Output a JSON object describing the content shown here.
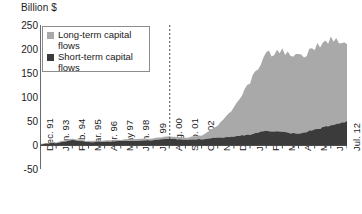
{
  "chart_data": {
    "type": "area",
    "title": "",
    "ylabel": "Billion $",
    "xlabel": "",
    "stacked": true,
    "grid": false,
    "legend_position": "top-left",
    "ylim": [
      -50,
      250
    ],
    "yticks": [
      250,
      200,
      150,
      100,
      50,
      0,
      -50
    ],
    "ytick_labels": [
      "250",
      "200",
      "150",
      "100",
      "50",
      "0",
      "-50"
    ],
    "categories": [
      "Dec. 91",
      "Jan. 93",
      "Feb. 94",
      "Mar. 95",
      "Apr. 96",
      "May 97",
      "Jun. 98",
      "Jul. 99",
      "Aug. 00",
      "Sep. 01",
      "Oct. 02",
      "Nov. 03",
      "Dec. 04",
      "Jan. 06",
      "Feb. 07",
      "Mar. 08",
      "Apr. 09",
      "May 10",
      "Jun. 11",
      "Jul. 12"
    ],
    "series": [
      {
        "name": "Short-term capital flows",
        "color": "#3b3b3b",
        "values": [
          2,
          4,
          10,
          6,
          7,
          8,
          9,
          10,
          13,
          11,
          12,
          15,
          17,
          22,
          30,
          27,
          23,
          32,
          40,
          50
        ]
      },
      {
        "name": "Long-term capital flows",
        "color": "#a9a9a9",
        "values": [
          1,
          2,
          3,
          2,
          3,
          3,
          4,
          4,
          5,
          4,
          8,
          25,
          60,
          110,
          160,
          168,
          160,
          170,
          178,
          160
        ]
      }
    ],
    "annotations": [
      {
        "type": "vertical-dashed-line",
        "at_category": "Aug. 00",
        "label": ""
      }
    ]
  },
  "legend": {
    "items": [
      {
        "label_line1": "Long-term capital",
        "label_line2": "flows",
        "color": "#a9a9a9"
      },
      {
        "label_line1": "Short-term capital",
        "label_line2": "flows",
        "color": "#3b3b3b"
      }
    ]
  }
}
